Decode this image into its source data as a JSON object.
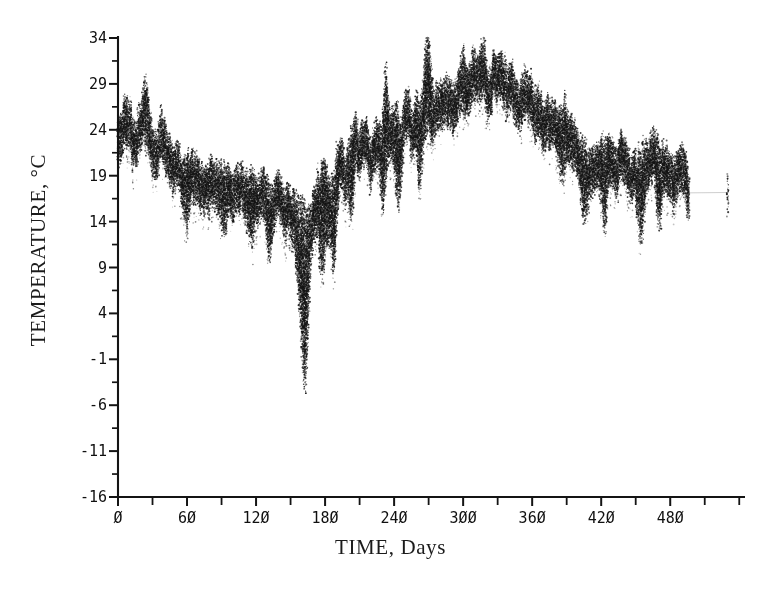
{
  "figure": {
    "background_color": "#ffffff",
    "ink_color": "#141414",
    "x_axis_title": "TIME, Days",
    "y_axis_title": "TEMPERATURE, °C"
  },
  "chart_data": {
    "type": "scatter",
    "title": "",
    "subtitle": "",
    "xlabel": "TIME, Days",
    "ylabel": "TEMPERATURE, °C",
    "xlim": [
      0,
      545
    ],
    "ylim": [
      -16,
      34
    ],
    "grid": false,
    "legend": null,
    "annotations": [],
    "marker": "dot",
    "x_major_tick_labels": [
      "Ø",
      "6Ø",
      "12Ø",
      "18Ø",
      "24Ø",
      "3ØØ",
      "36Ø",
      "42Ø",
      "48Ø"
    ],
    "x_major_tick_values": [
      0,
      60,
      120,
      180,
      240,
      300,
      360,
      420,
      480
    ],
    "x_minor_tick_values": [
      30,
      90,
      150,
      210,
      270,
      330,
      390,
      450,
      510,
      540
    ],
    "y_major_tick_labels": [
      "34",
      "29",
      "24",
      "19",
      "14",
      "9",
      "4",
      "-1",
      "-6",
      "-11",
      "-16"
    ],
    "y_major_tick_values": [
      34,
      29,
      24,
      19,
      14,
      9,
      4,
      -1,
      -6,
      -11,
      -16
    ],
    "y_minor_tick_values": [
      31.5,
      26.5,
      21.5,
      16.5,
      11.5,
      6.5,
      1.5,
      -3.5,
      -8.5,
      -13.5
    ],
    "series": [
      {
        "name": "water temperature",
        "description": "Daily temperature record, dense dotted trace with large diurnal scatter",
        "x": [
          0,
          2,
          4,
          6,
          8,
          10,
          12,
          14,
          16,
          18,
          20,
          22,
          24,
          26,
          28,
          30,
          32,
          34,
          36,
          38,
          40,
          42,
          44,
          46,
          48,
          50,
          52,
          54,
          56,
          58,
          60,
          62,
          64,
          66,
          68,
          70,
          72,
          74,
          76,
          78,
          80,
          82,
          84,
          86,
          88,
          90,
          92,
          94,
          96,
          98,
          100,
          102,
          104,
          106,
          108,
          110,
          112,
          114,
          116,
          118,
          120,
          122,
          124,
          126,
          128,
          130,
          132,
          134,
          136,
          138,
          140,
          142,
          144,
          146,
          148,
          150,
          152,
          154,
          156,
          158,
          160,
          162,
          164,
          166,
          168,
          170,
          172,
          174,
          176,
          178,
          180,
          182,
          184,
          186,
          188,
          190,
          192,
          194,
          196,
          198,
          200,
          202,
          204,
          206,
          208,
          210,
          212,
          214,
          216,
          218,
          220,
          222,
          224,
          226,
          228,
          230,
          232,
          234,
          236,
          238,
          240,
          242,
          244,
          246,
          248,
          250,
          252,
          254,
          256,
          258,
          260,
          262,
          264,
          266,
          268,
          270,
          272,
          274,
          276,
          278,
          280,
          282,
          284,
          286,
          288,
          290,
          292,
          294,
          296,
          298,
          300,
          302,
          304,
          306,
          308,
          310,
          312,
          314,
          316,
          318,
          320,
          322,
          324,
          326,
          328,
          330,
          332,
          334,
          336,
          338,
          340,
          342,
          344,
          346,
          348,
          350,
          352,
          354,
          356,
          358,
          360,
          362,
          364,
          366,
          368,
          370,
          372,
          374,
          376,
          378,
          380,
          382,
          384,
          386,
          388,
          390,
          392,
          394,
          396,
          398,
          400,
          402,
          404,
          406,
          408,
          410,
          412,
          414,
          416,
          418,
          420,
          422,
          424,
          426,
          428,
          430,
          432,
          434,
          436,
          438,
          440,
          442,
          444,
          446,
          448,
          450,
          452,
          454,
          456,
          458,
          460,
          462,
          464,
          466,
          468,
          470,
          472,
          474,
          476,
          478,
          480,
          482,
          484,
          486,
          488,
          490,
          492,
          494,
          496,
          498,
          500,
          502,
          504,
          506,
          508,
          510,
          512,
          514,
          516,
          518,
          520,
          522,
          524,
          526,
          528,
          530
        ],
        "y_mean": [
          23.5,
          24.2,
          24.8,
          25.4,
          25.8,
          25.2,
          24.4,
          23.6,
          23.0,
          23.6,
          24.4,
          25.0,
          24.4,
          23.4,
          22.4,
          21.6,
          21.0,
          21.6,
          22.6,
          23.2,
          22.4,
          21.4,
          20.6,
          20.0,
          19.6,
          19.2,
          19.0,
          19.4,
          19.8,
          19.6,
          19.2,
          19.0,
          19.4,
          19.8,
          19.6,
          19.2,
          18.8,
          18.4,
          18.2,
          18.6,
          18.4,
          18.0,
          17.6,
          17.4,
          17.2,
          17.6,
          17.8,
          17.4,
          17.0,
          16.8,
          16.6,
          17.0,
          17.4,
          17.2,
          16.8,
          16.4,
          16.2,
          16.6,
          17.0,
          16.8,
          16.4,
          16.2,
          16.6,
          17.0,
          16.6,
          16.2,
          15.8,
          15.6,
          16.0,
          16.4,
          16.2,
          15.8,
          15.4,
          15.6,
          16.0,
          15.8,
          15.4,
          15.2,
          15.6,
          15.2,
          14.6,
          14.0,
          13.4,
          13.8,
          14.4,
          15.0,
          15.8,
          16.4,
          17.0,
          17.6,
          18.0,
          17.4,
          16.8,
          17.4,
          18.2,
          19.0,
          19.8,
          20.4,
          20.0,
          19.4,
          20.2,
          21.0,
          21.8,
          22.4,
          21.8,
          21.2,
          21.8,
          22.6,
          23.2,
          22.6,
          22.0,
          22.6,
          23.2,
          22.8,
          22.2,
          22.8,
          23.4,
          23.0,
          22.4,
          23.0,
          23.8,
          24.4,
          23.8,
          23.2,
          23.8,
          24.6,
          25.2,
          24.6,
          24.0,
          24.6,
          25.4,
          25.0,
          24.4,
          25.0,
          25.8,
          26.4,
          25.8,
          25.2,
          25.8,
          26.6,
          27.2,
          26.6,
          26.0,
          26.6,
          27.4,
          28.0,
          27.4,
          26.8,
          27.4,
          28.2,
          28.8,
          28.2,
          27.6,
          28.2,
          29.0,
          29.6,
          29.0,
          28.4,
          29.0,
          29.4,
          29.0,
          28.6,
          29.0,
          29.2,
          28.8,
          28.4,
          28.6,
          28.8,
          28.4,
          28.0,
          28.2,
          28.4,
          28.0,
          27.6,
          27.8,
          28.0,
          27.6,
          27.2,
          27.4,
          27.0,
          26.6,
          26.2,
          26.4,
          26.0,
          25.6,
          25.2,
          25.4,
          25.0,
          24.6,
          24.2,
          24.4,
          24.0,
          23.6,
          23.2,
          23.4,
          23.0,
          22.6,
          22.2,
          22.4,
          22.0,
          21.6,
          21.2,
          21.4,
          21.0,
          20.6,
          20.2,
          20.4,
          20.0,
          19.8,
          20.2,
          20.6,
          20.2,
          19.8,
          20.2,
          20.6,
          20.2,
          19.8,
          19.4,
          19.8,
          20.2,
          19.8,
          19.4,
          19.0,
          19.4,
          19.8,
          20.2,
          19.8,
          19.4,
          19.8,
          20.2,
          19.8,
          19.4,
          19.0,
          19.4,
          19.8,
          19.4,
          19.0,
          18.6,
          19.0,
          19.4,
          19.0,
          18.6,
          18.2,
          18.6,
          19.0,
          18.6,
          18.2,
          17.8,
          17.4
        ],
        "y_daily_spread": 4.5,
        "y_min_observed": 5.5,
        "y_max_observed": 33.5,
        "notes": "Seasonal cycle: starts near 24-28 C, declines to an annual minimum near day 160 (dips to ~6 C), rises through days 180-300 to a maximum near 30-31 C around day 300-330, then declines toward ~17-20 C by day 530"
      }
    ]
  }
}
